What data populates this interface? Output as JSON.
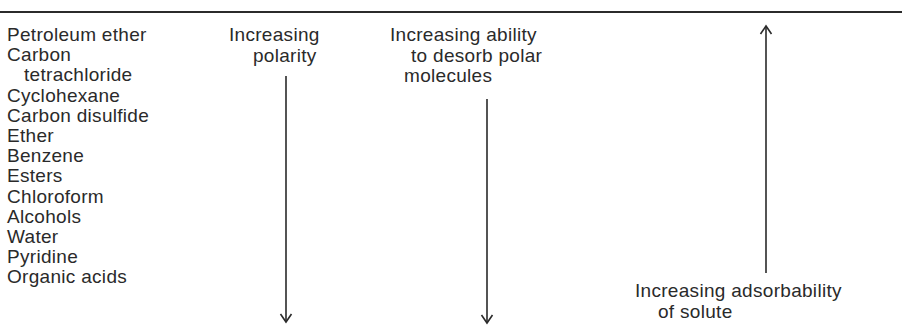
{
  "solvents": [
    {
      "name": "Petroleum ether",
      "indent": false
    },
    {
      "name": "Carbon",
      "indent": false
    },
    {
      "name": "tetrachloride",
      "indent": true
    },
    {
      "name": "Cyclohexane",
      "indent": false
    },
    {
      "name": "Carbon disulfide",
      "indent": false
    },
    {
      "name": "Ether",
      "indent": false
    },
    {
      "name": "Benzene",
      "indent": false
    },
    {
      "name": "Esters",
      "indent": false
    },
    {
      "name": "Chloroform",
      "indent": false
    },
    {
      "name": "Alcohols",
      "indent": false
    },
    {
      "name": "Water",
      "indent": false
    },
    {
      "name": "Pyridine",
      "indent": false
    },
    {
      "name": "Organic acids",
      "indent": false
    }
  ],
  "columns": {
    "polarity": {
      "line1": "Increasing",
      "line2": "polarity",
      "arrow": "down-arrow"
    },
    "desorb": {
      "line1": "Increasing ability",
      "line2": "to desorb polar",
      "line3": "molecules",
      "arrow": "down-arrow"
    },
    "adsorbability": {
      "line1": "Increasing adsorbability",
      "line2": "of solute",
      "arrow": "up-arrow"
    }
  },
  "colors": {
    "ink": "#2a2a2a",
    "background": "#ffffff"
  }
}
